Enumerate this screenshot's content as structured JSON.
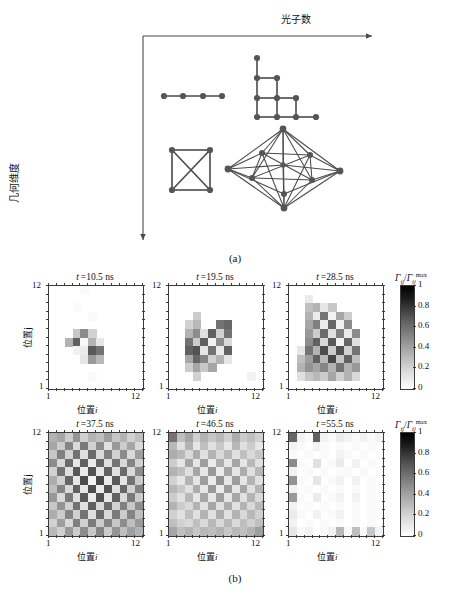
{
  "figure": {
    "caption_a": "(a)",
    "caption_b": "(b)"
  },
  "panel_a": {
    "axis_x_label": "光子数",
    "axis_y_label": "几何维度",
    "graphs": [
      {
        "name": "path-graph-4-nodes",
        "nodes": 4,
        "edges": 3,
        "position": "top-left"
      },
      {
        "name": "lattice-graph",
        "nodes": 10,
        "edges": 11,
        "position": "top-right"
      },
      {
        "name": "complete-graph-k4",
        "nodes": 4,
        "edges": 6,
        "position": "bottom-left"
      },
      {
        "name": "polyhedral-graph",
        "nodes": 10,
        "edges": 29,
        "position": "bottom-right"
      }
    ]
  },
  "panel_b": {
    "x_axis_label_cn": "位置",
    "x_axis_label_var": "i",
    "y_axis_label_cn": "位置",
    "y_axis_label_var": "j",
    "axis_min": "1",
    "axis_max": "12",
    "colorbar": {
      "label_numer": "Γ",
      "label_numer_sub": "ij",
      "label_denom": "Γ",
      "label_denom_sub": "ij",
      "label_denom_sup": "max",
      "ticks": [
        "1",
        "0.8",
        "0.6",
        "0.4",
        "0.2",
        "0"
      ],
      "vmin": 0,
      "vmax": 1,
      "cmap": "gray-reversed"
    },
    "panels": [
      {
        "title_var": "t",
        "title_value": "10.5",
        "title_unit": "ns"
      },
      {
        "title_var": "t",
        "title_value": "19.5",
        "title_unit": "ns"
      },
      {
        "title_var": "t",
        "title_value": "28.5",
        "title_unit": "ns"
      },
      {
        "title_var": "t",
        "title_value": "37.5",
        "title_unit": "ns"
      },
      {
        "title_var": "t",
        "title_value": "46.5",
        "title_unit": "ns"
      },
      {
        "title_var": "t",
        "title_value": "55.5",
        "title_unit": "ns"
      }
    ]
  },
  "chart_data": {
    "type": "heatmap",
    "xlabel": "位置 i",
    "ylabel": "位置 j",
    "x": [
      1,
      2,
      3,
      4,
      5,
      6,
      7,
      8,
      9,
      10,
      11,
      12
    ],
    "y": [
      1,
      2,
      3,
      4,
      5,
      6,
      7,
      8,
      9,
      10,
      11,
      12
    ],
    "xlim": [
      1,
      12
    ],
    "ylim": [
      1,
      12
    ],
    "zlim": [
      0,
      1
    ],
    "grid": false,
    "legend_position": "right",
    "colorbar_label": "Gamma_ij / Gamma_ij^max",
    "colorbar_ticks": [
      0,
      0.2,
      0.4,
      0.6,
      0.8,
      1
    ],
    "panels": [
      {
        "title": "t = 10.5 ns",
        "values": [
          [
            0.0,
            0.0,
            0.0,
            0.0,
            0.02,
            0.0,
            0.0,
            0.0,
            0.0,
            0.0,
            0.0,
            0.0
          ],
          [
            0.0,
            0.0,
            0.0,
            0.0,
            0.0,
            0.0,
            0.0,
            0.0,
            0.0,
            0.0,
            0.0,
            0.0
          ],
          [
            0.0,
            0.0,
            0.0,
            0.02,
            0.0,
            0.0,
            0.0,
            0.0,
            0.0,
            0.0,
            0.0,
            0.0
          ],
          [
            0.0,
            0.0,
            0.0,
            0.0,
            0.0,
            0.02,
            0.0,
            0.0,
            0.0,
            0.0,
            0.0,
            0.0
          ],
          [
            0.0,
            0.0,
            0.0,
            0.0,
            0.0,
            0.0,
            0.0,
            0.0,
            0.0,
            0.0,
            0.0,
            0.0
          ],
          [
            0.0,
            0.0,
            0.0,
            0.22,
            0.45,
            0.18,
            0.0,
            0.0,
            0.0,
            0.0,
            0.0,
            0.0
          ],
          [
            0.0,
            0.0,
            0.3,
            0.62,
            0.03,
            0.3,
            0.1,
            0.0,
            0.0,
            0.0,
            0.0,
            0.0
          ],
          [
            0.0,
            0.0,
            0.0,
            0.05,
            0.08,
            0.65,
            0.55,
            0.0,
            0.0,
            0.0,
            0.0,
            0.0
          ],
          [
            0.0,
            0.0,
            0.0,
            0.0,
            0.1,
            0.4,
            0.28,
            0.0,
            0.0,
            0.0,
            0.0,
            0.0
          ],
          [
            0.0,
            0.0,
            0.0,
            0.0,
            0.0,
            0.0,
            0.0,
            0.0,
            0.0,
            0.0,
            0.0,
            0.0
          ],
          [
            0.0,
            0.0,
            0.0,
            0.0,
            0.0,
            0.02,
            0.0,
            0.0,
            0.0,
            0.0,
            0.0,
            0.0
          ],
          [
            0.0,
            0.0,
            0.0,
            0.0,
            0.0,
            0.0,
            0.0,
            0.0,
            0.0,
            0.0,
            0.0,
            0.0
          ]
        ]
      },
      {
        "title": "t = 19.5 ns",
        "values": [
          [
            0.0,
            0.0,
            0.0,
            0.0,
            0.0,
            0.0,
            0.0,
            0.0,
            0.0,
            0.0,
            0.0,
            0.0
          ],
          [
            0.0,
            0.0,
            0.0,
            0.0,
            0.0,
            0.0,
            0.0,
            0.0,
            0.0,
            0.0,
            0.0,
            0.0
          ],
          [
            0.0,
            0.0,
            0.0,
            0.0,
            0.0,
            0.0,
            0.0,
            0.0,
            0.0,
            0.0,
            0.0,
            0.0
          ],
          [
            0.0,
            0.0,
            0.0,
            0.2,
            0.0,
            0.0,
            0.0,
            0.0,
            0.0,
            0.0,
            0.0,
            0.0
          ],
          [
            0.0,
            0.0,
            0.18,
            0.28,
            0.0,
            0.0,
            0.55,
            0.6,
            0.0,
            0.0,
            0.0,
            0.0
          ],
          [
            0.0,
            0.0,
            0.3,
            0.45,
            0.12,
            0.62,
            0.18,
            0.55,
            0.0,
            0.0,
            0.0,
            0.0
          ],
          [
            0.0,
            0.0,
            0.55,
            0.2,
            0.62,
            0.05,
            0.45,
            0.15,
            0.0,
            0.0,
            0.0,
            0.0
          ],
          [
            0.0,
            0.0,
            0.62,
            0.68,
            0.1,
            0.55,
            0.08,
            0.62,
            0.0,
            0.0,
            0.0,
            0.0
          ],
          [
            0.0,
            0.0,
            0.35,
            0.6,
            0.48,
            0.18,
            0.3,
            0.1,
            0.0,
            0.0,
            0.0,
            0.0
          ],
          [
            0.0,
            0.0,
            0.2,
            0.35,
            0.22,
            0.35,
            0.0,
            0.0,
            0.0,
            0.0,
            0.0,
            0.0
          ],
          [
            0.0,
            0.0,
            0.0,
            0.18,
            0.0,
            0.0,
            0.0,
            0.0,
            0.0,
            0.0,
            0.05,
            0.0
          ],
          [
            0.0,
            0.0,
            0.0,
            0.0,
            0.0,
            0.0,
            0.0,
            0.0,
            0.0,
            0.0,
            0.0,
            0.0
          ]
        ]
      },
      {
        "title": "t = 28.5 ns",
        "values": [
          [
            0.0,
            0.0,
            0.0,
            0.0,
            0.0,
            0.0,
            0.0,
            0.0,
            0.0,
            0.0,
            0.0,
            0.0
          ],
          [
            0.0,
            0.0,
            0.08,
            0.0,
            0.0,
            0.0,
            0.0,
            0.0,
            0.0,
            0.0,
            0.0,
            0.0
          ],
          [
            0.0,
            0.0,
            0.25,
            0.3,
            0.1,
            0.22,
            0.0,
            0.0,
            0.0,
            0.0,
            0.0,
            0.0
          ],
          [
            0.0,
            0.0,
            0.3,
            0.08,
            0.55,
            0.05,
            0.35,
            0.2,
            0.0,
            0.0,
            0.0,
            0.0
          ],
          [
            0.0,
            0.0,
            0.35,
            0.5,
            0.08,
            0.6,
            0.05,
            0.45,
            0.0,
            0.0,
            0.0,
            0.0
          ],
          [
            0.0,
            0.0,
            0.4,
            0.2,
            0.58,
            0.12,
            0.5,
            0.08,
            0.45,
            0.0,
            0.0,
            0.0
          ],
          [
            0.0,
            0.0,
            0.45,
            0.62,
            0.15,
            0.65,
            0.05,
            0.6,
            0.12,
            0.0,
            0.0,
            0.0
          ],
          [
            0.0,
            0.1,
            0.55,
            0.3,
            0.7,
            0.2,
            0.68,
            0.18,
            0.55,
            0.0,
            0.0,
            0.0
          ],
          [
            0.0,
            0.25,
            0.38,
            0.62,
            0.28,
            0.72,
            0.22,
            0.62,
            0.25,
            0.0,
            0.0,
            0.0
          ],
          [
            0.0,
            0.3,
            0.42,
            0.35,
            0.48,
            0.3,
            0.55,
            0.3,
            0.4,
            0.0,
            0.0,
            0.0
          ],
          [
            0.0,
            0.12,
            0.22,
            0.28,
            0.2,
            0.35,
            0.18,
            0.3,
            0.15,
            0.0,
            0.0,
            0.0
          ],
          [
            0.0,
            0.0,
            0.0,
            0.0,
            0.0,
            0.0,
            0.0,
            0.0,
            0.0,
            0.0,
            0.0,
            0.0
          ]
        ]
      },
      {
        "title": "t = 37.5 ns",
        "values": [
          [
            0.3,
            0.35,
            0.2,
            0.42,
            0.18,
            0.3,
            0.25,
            0.38,
            0.22,
            0.3,
            0.18,
            0.25
          ],
          [
            0.35,
            0.2,
            0.48,
            0.15,
            0.52,
            0.18,
            0.45,
            0.12,
            0.4,
            0.2,
            0.35,
            0.15
          ],
          [
            0.22,
            0.5,
            0.18,
            0.55,
            0.12,
            0.58,
            0.15,
            0.5,
            0.18,
            0.45,
            0.15,
            0.38
          ],
          [
            0.45,
            0.15,
            0.58,
            0.1,
            0.62,
            0.08,
            0.6,
            0.12,
            0.55,
            0.15,
            0.48,
            0.18
          ],
          [
            0.18,
            0.55,
            0.12,
            0.65,
            0.08,
            0.68,
            0.1,
            0.62,
            0.12,
            0.58,
            0.15,
            0.45
          ],
          [
            0.32,
            0.18,
            0.6,
            0.1,
            0.7,
            0.05,
            0.72,
            0.08,
            0.65,
            0.1,
            0.55,
            0.2
          ],
          [
            0.25,
            0.48,
            0.15,
            0.62,
            0.1,
            0.7,
            0.08,
            0.68,
            0.12,
            0.6,
            0.18,
            0.5
          ],
          [
            0.4,
            0.15,
            0.52,
            0.12,
            0.65,
            0.08,
            0.68,
            0.1,
            0.62,
            0.15,
            0.52,
            0.2
          ],
          [
            0.22,
            0.42,
            0.18,
            0.55,
            0.12,
            0.62,
            0.15,
            0.58,
            0.18,
            0.5,
            0.22,
            0.45
          ],
          [
            0.32,
            0.2,
            0.48,
            0.18,
            0.55,
            0.12,
            0.58,
            0.15,
            0.52,
            0.2,
            0.48,
            0.25
          ],
          [
            0.18,
            0.38,
            0.15,
            0.5,
            0.18,
            0.52,
            0.2,
            0.48,
            0.22,
            0.45,
            0.25,
            0.4
          ],
          [
            0.28,
            0.18,
            0.4,
            0.2,
            0.45,
            0.22,
            0.48,
            0.2,
            0.42,
            0.25,
            0.38,
            0.3
          ]
        ]
      },
      {
        "title": "t = 46.5 ns",
        "values": [
          [
            0.55,
            0.25,
            0.35,
            0.18,
            0.3,
            0.22,
            0.28,
            0.18,
            0.32,
            0.2,
            0.25,
            0.18
          ],
          [
            0.28,
            0.12,
            0.3,
            0.1,
            0.25,
            0.12,
            0.22,
            0.1,
            0.28,
            0.12,
            0.2,
            0.1
          ],
          [
            0.32,
            0.28,
            0.15,
            0.32,
            0.12,
            0.3,
            0.15,
            0.28,
            0.12,
            0.25,
            0.15,
            0.22
          ],
          [
            0.2,
            0.1,
            0.35,
            0.1,
            0.38,
            0.08,
            0.32,
            0.1,
            0.35,
            0.1,
            0.28,
            0.12
          ],
          [
            0.3,
            0.25,
            0.12,
            0.35,
            0.1,
            0.4,
            0.08,
            0.35,
            0.1,
            0.32,
            0.12,
            0.28
          ],
          [
            0.18,
            0.1,
            0.3,
            0.1,
            0.38,
            0.08,
            0.42,
            0.1,
            0.38,
            0.1,
            0.3,
            0.12
          ],
          [
            0.28,
            0.22,
            0.12,
            0.32,
            0.1,
            0.4,
            0.08,
            0.38,
            0.1,
            0.35,
            0.12,
            0.3
          ],
          [
            0.2,
            0.12,
            0.28,
            0.1,
            0.35,
            0.1,
            0.38,
            0.1,
            0.35,
            0.12,
            0.3,
            0.15
          ],
          [
            0.3,
            0.2,
            0.15,
            0.3,
            0.12,
            0.35,
            0.12,
            0.32,
            0.12,
            0.3,
            0.15,
            0.28
          ],
          [
            0.18,
            0.12,
            0.25,
            0.12,
            0.3,
            0.12,
            0.32,
            0.12,
            0.3,
            0.15,
            0.28,
            0.18
          ],
          [
            0.25,
            0.18,
            0.15,
            0.25,
            0.15,
            0.28,
            0.15,
            0.28,
            0.15,
            0.25,
            0.18,
            0.25
          ],
          [
            0.35,
            0.25,
            0.3,
            0.22,
            0.28,
            0.25,
            0.3,
            0.22,
            0.28,
            0.25,
            0.3,
            0.38
          ]
        ]
      },
      {
        "title": "t = 55.5 ns",
        "values": [
          [
            0.6,
            0.05,
            0.02,
            0.62,
            0.05,
            0.02,
            0.08,
            0.05,
            0.02,
            0.05,
            0.02,
            0.05
          ],
          [
            0.05,
            0.02,
            0.0,
            0.05,
            0.02,
            0.0,
            0.02,
            0.0,
            0.02,
            0.0,
            0.02,
            0.0
          ],
          [
            0.02,
            0.0,
            0.02,
            0.0,
            0.02,
            0.0,
            0.05,
            0.02,
            0.0,
            0.02,
            0.0,
            0.02
          ],
          [
            0.45,
            0.02,
            0.0,
            0.12,
            0.0,
            0.02,
            0.08,
            0.0,
            0.05,
            0.0,
            0.02,
            0.0
          ],
          [
            0.05,
            0.0,
            0.02,
            0.0,
            0.02,
            0.0,
            0.02,
            0.02,
            0.0,
            0.02,
            0.0,
            0.02
          ],
          [
            0.42,
            0.02,
            0.0,
            0.1,
            0.0,
            0.02,
            0.05,
            0.0,
            0.05,
            0.0,
            0.02,
            0.0
          ],
          [
            0.05,
            0.0,
            0.02,
            0.0,
            0.02,
            0.0,
            0.02,
            0.0,
            0.02,
            0.0,
            0.02,
            0.0
          ],
          [
            0.4,
            0.02,
            0.0,
            0.08,
            0.0,
            0.02,
            0.05,
            0.0,
            0.05,
            0.0,
            0.02,
            0.0
          ],
          [
            0.05,
            0.0,
            0.02,
            0.0,
            0.02,
            0.0,
            0.02,
            0.0,
            0.02,
            0.0,
            0.02,
            0.0
          ],
          [
            0.08,
            0.02,
            0.0,
            0.05,
            0.0,
            0.02,
            0.05,
            0.0,
            0.02,
            0.0,
            0.02,
            0.0
          ],
          [
            0.05,
            0.0,
            0.02,
            0.0,
            0.02,
            0.0,
            0.02,
            0.0,
            0.02,
            0.0,
            0.02,
            0.0
          ],
          [
            0.1,
            0.02,
            0.05,
            0.0,
            0.02,
            0.05,
            0.28,
            0.02,
            0.25,
            0.02,
            0.22,
            0.05
          ]
        ]
      }
    ]
  }
}
